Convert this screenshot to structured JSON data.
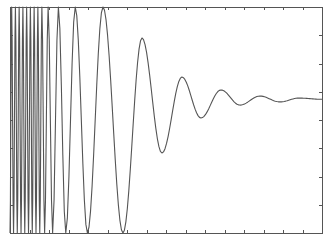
{
  "chart_data": {
    "type": "line",
    "title": "",
    "xlabel": "",
    "ylabel": "",
    "grid": false,
    "legend": null,
    "tick_labels_visible": false,
    "normalized_axes": {
      "xlim": [
        0,
        1
      ],
      "ylim": [
        0,
        1
      ],
      "x_ticks": [
        0,
        0.0625,
        0.125,
        0.1875,
        0.25,
        0.3125,
        0.375,
        0.4375,
        0.5,
        0.5625,
        0.625,
        0.6875,
        0.75,
        0.8125,
        0.875,
        0.9375,
        1
      ],
      "y_ticks": [
        0,
        0.125,
        0.25,
        0.375,
        0.5,
        0.625,
        0.75,
        0.875,
        1
      ]
    },
    "series": [
      {
        "name": "signal",
        "color": "#555555",
        "settle_level": 0.588,
        "peaks": [
          {
            "x": 0.298,
            "y": 1.0
          },
          {
            "x": 0.423,
            "y": 0.863
          },
          {
            "x": 0.551,
            "y": 0.69
          },
          {
            "x": 0.676,
            "y": 0.633
          },
          {
            "x": 0.801,
            "y": 0.606
          },
          {
            "x": 0.926,
            "y": 0.597
          }
        ],
        "troughs": [
          {
            "x": 0.362,
            "y": 0.0
          },
          {
            "x": 0.487,
            "y": 0.354
          },
          {
            "x": 0.612,
            "y": 0.509
          },
          {
            "x": 0.737,
            "y": 0.566
          },
          {
            "x": 0.865,
            "y": 0.58
          }
        ]
      }
    ]
  },
  "render": {
    "box": {
      "x0": 10,
      "y0": 7,
      "x1": 322,
      "y1": 233
    },
    "tick_len": 3,
    "curve_color": "#555555",
    "axis_color": "#555555",
    "background": "#ffffff"
  }
}
